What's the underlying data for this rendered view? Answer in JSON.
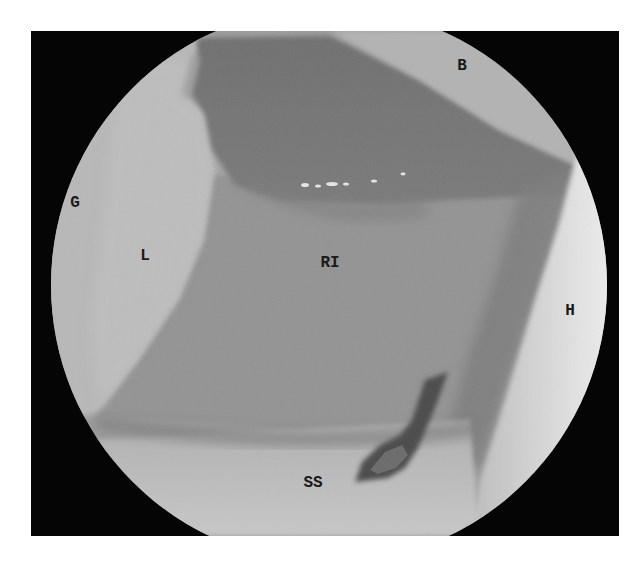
{
  "image": {
    "type": "arthroscopic-photograph",
    "colors": {
      "frame_background": "#050505",
      "page_background": "#ffffff",
      "label_color": "#1a1a1a",
      "bright_tissue": "#c8c8c8",
      "mid_tissue": "#8e8e8e",
      "dark_tissue": "#6a6a6a"
    }
  },
  "labels": [
    {
      "id": "B",
      "text": "B",
      "x": 462,
      "y": 66
    },
    {
      "id": "G",
      "text": "G",
      "x": 75,
      "y": 203
    },
    {
      "id": "L",
      "text": "L",
      "x": 145,
      "y": 256
    },
    {
      "id": "RI",
      "text": "RI",
      "x": 330,
      "y": 263
    },
    {
      "id": "H",
      "text": "H",
      "x": 570,
      "y": 311
    },
    {
      "id": "SS",
      "text": "SS",
      "x": 313,
      "y": 483
    }
  ]
}
